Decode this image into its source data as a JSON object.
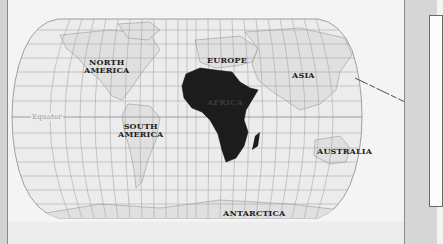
{
  "map": {
    "projection": "Robinson-style world map",
    "highlighted_continent": "Africa",
    "colors": {
      "background": "#f4f4f4",
      "land": "#e2e2e2",
      "highlight": "#1c1c1c",
      "grid": "#9c9c9c",
      "panel": "#d6d6d6"
    },
    "labels": {
      "north_america_line1": "NORTH",
      "north_america_line2": "AMERICA",
      "south_america_line1": "SOUTH",
      "south_america_line2": "AMERICA",
      "europe": "EUROPE",
      "africa": "AFRICA",
      "asia": "ASIA",
      "australia": "AUSTRALIA",
      "antarctica": "ANTARCTICA",
      "equator": "Equator"
    }
  },
  "callout": {
    "pointer_from": "Asia (Japan region)",
    "box_text": ""
  }
}
